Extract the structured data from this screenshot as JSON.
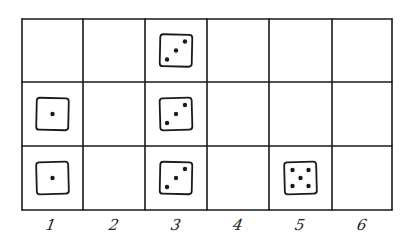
{
  "diagram": {
    "columns": 6,
    "rows": 3,
    "column_labels": [
      "1",
      "2",
      "3",
      "4",
      "5",
      "6"
    ],
    "line_color": "#1a1a1a",
    "dice": [
      {
        "column": 1,
        "row": 2,
        "value": 1
      },
      {
        "column": 1,
        "row": 3,
        "value": 1
      },
      {
        "column": 3,
        "row": 1,
        "value": 3
      },
      {
        "column": 3,
        "row": 2,
        "value": 3
      },
      {
        "column": 3,
        "row": 3,
        "value": 3
      },
      {
        "column": 5,
        "row": 3,
        "value": 5
      }
    ]
  }
}
